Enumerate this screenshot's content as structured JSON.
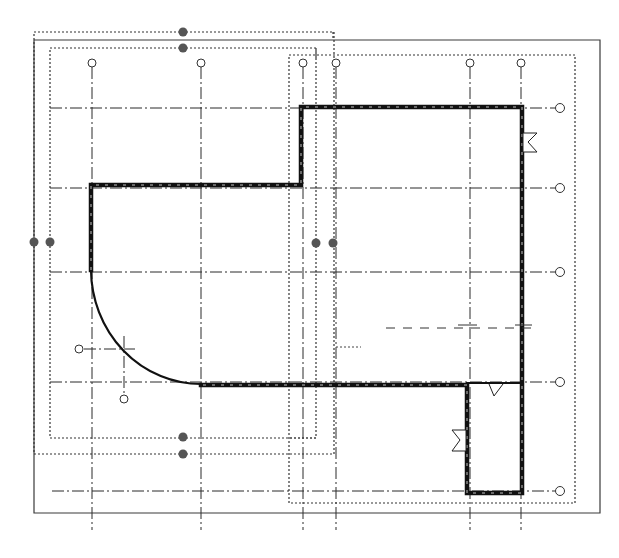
{
  "drawing": {
    "type": "floor-plan",
    "view": "CAD plan view",
    "elements": {
      "vertical_grids": [
        "grid-1",
        "grid-2",
        "grid-3",
        "grid-4",
        "grid-5",
        "grid-6"
      ],
      "horizontal_grids": [
        "grid-A",
        "grid-B",
        "grid-C",
        "grid-D",
        "grid-E"
      ],
      "doors": [
        "door-east-upper",
        "door-annex-west",
        "door-annex-north"
      ],
      "level_handles": [
        "handle-top-outer",
        "handle-top-inner",
        "handle-left-outer",
        "handle-left-inner",
        "handle-mid-left",
        "handle-mid-right",
        "handle-bottom-inner",
        "handle-bottom-outer"
      ]
    },
    "icons": {
      "grid_bubble": "grid-bubble-icon",
      "level_handle": "drag-handle-icon",
      "door_swing": "door-swing-icon"
    },
    "colors": {
      "line": "#111111",
      "handle": "#555555",
      "background": "#ffffff"
    }
  }
}
